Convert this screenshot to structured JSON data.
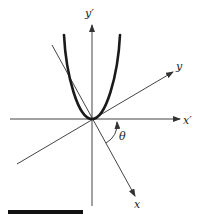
{
  "diagram": {
    "type": "rotated-coordinate-axes-with-parabola",
    "labels": {
      "y_prime": "y′",
      "x_prime": "x′",
      "y": "y",
      "x": "x",
      "theta": "θ"
    },
    "colors": {
      "axis": "#444444",
      "curve": "#1a1a1a",
      "bar": "#111111"
    }
  }
}
